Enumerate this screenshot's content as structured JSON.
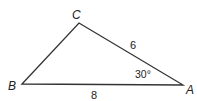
{
  "diagram": {
    "type": "triangle",
    "stroke_color": "#333333",
    "vertices": [
      {
        "id": "A",
        "label": "A",
        "x": 183,
        "y": 85
      },
      {
        "id": "B",
        "label": "B",
        "x": 22,
        "y": 84
      },
      {
        "id": "C",
        "label": "C",
        "x": 79,
        "y": 23
      }
    ],
    "sides": [
      {
        "between": "C-A",
        "label": "6"
      },
      {
        "between": "B-A",
        "label": "8"
      }
    ],
    "angles": [
      {
        "at": "A",
        "label": "30°"
      }
    ]
  }
}
